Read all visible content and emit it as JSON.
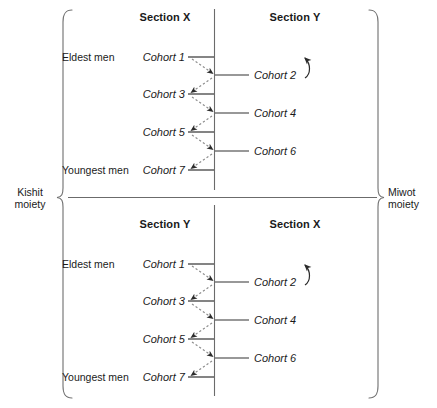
{
  "diagram": {
    "moieties": {
      "left": {
        "name": "Kishit",
        "word": "moiety"
      },
      "right": {
        "name": "Miwot",
        "word": "moiety"
      }
    },
    "panels": [
      {
        "id": "top",
        "left_section": "Section X",
        "right_section": "Section Y",
        "eldest_label": "Eldest men",
        "youngest_label": "Youngest men",
        "cohorts": [
          {
            "label": "Cohort 1",
            "side": "left",
            "row": 1
          },
          {
            "label": "Cohort 2",
            "side": "right",
            "row": 2
          },
          {
            "label": "Cohort 3",
            "side": "left",
            "row": 3
          },
          {
            "label": "Cohort 4",
            "side": "right",
            "row": 4
          },
          {
            "label": "Cohort 5",
            "side": "left",
            "row": 5
          },
          {
            "label": "Cohort 6",
            "side": "right",
            "row": 6
          },
          {
            "label": "Cohort 7",
            "side": "left",
            "row": 7
          }
        ]
      },
      {
        "id": "bottom",
        "left_section": "Section Y",
        "right_section": "Section X",
        "eldest_label": "Eldest men",
        "youngest_label": "Youngest men",
        "cohorts": [
          {
            "label": "Cohort 1",
            "side": "left",
            "row": 1
          },
          {
            "label": "Cohort 2",
            "side": "right",
            "row": 2
          },
          {
            "label": "Cohort 3",
            "side": "left",
            "row": 3
          },
          {
            "label": "Cohort 4",
            "side": "right",
            "row": 4
          },
          {
            "label": "Cohort 5",
            "side": "left",
            "row": 5
          },
          {
            "label": "Cohort 6",
            "side": "right",
            "row": 6
          },
          {
            "label": "Cohort 7",
            "side": "left",
            "row": 7
          }
        ]
      }
    ],
    "colors": {
      "line": "#4d4d4d",
      "dashed": "#808080",
      "text": "#1a1a1a",
      "background": "#ffffff"
    }
  }
}
